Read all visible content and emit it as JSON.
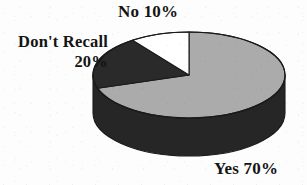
{
  "chart_data": {
    "type": "pie",
    "title": "",
    "subtitle": "",
    "xlabel": "",
    "ylabel": "",
    "three_d": true,
    "legend_position": "none",
    "grid": false,
    "start_angle_deg": -90,
    "direction": "clockwise",
    "categories": [
      "Yes",
      "Don't Recall",
      "No"
    ],
    "values": [
      70,
      20,
      10
    ],
    "units": "percent",
    "total": 100,
    "slices": [
      {
        "name": "Yes",
        "label": "Yes 70%",
        "value": 70,
        "value_text": "70%",
        "sweep_deg": 252,
        "color": "#ababab",
        "side_color": "#262626",
        "label_position": "bottom-right"
      },
      {
        "name": "Don't Recall",
        "label": "Don't Recall 20%",
        "value": 20,
        "value_text": "20%",
        "sweep_deg": 72,
        "color": "#2a2a2a",
        "side_color": "#262626",
        "label_position": "top-left"
      },
      {
        "name": "No",
        "label": "No 10%",
        "value": 10,
        "value_text": "10%",
        "sweep_deg": 36,
        "color": "#ffffff",
        "side_color": "#262626",
        "label_position": "top-center"
      }
    ],
    "geometry": {
      "center_x": 189,
      "center_y": 75,
      "radius_x": 96,
      "radius_y": 43,
      "depth": 38
    }
  },
  "labels": {
    "no": "No 10%",
    "dont_recall_name": "Don't Recall",
    "dont_recall_value": "20%",
    "yes": "Yes 70%"
  },
  "colors": {
    "background": "#fdfdfd",
    "slice_yes": "#ababab",
    "slice_dont_recall": "#2a2a2a",
    "slice_no": "#ffffff",
    "cylinder_side": "#262626",
    "outline": "#1a1a1a",
    "text": "#141414"
  }
}
